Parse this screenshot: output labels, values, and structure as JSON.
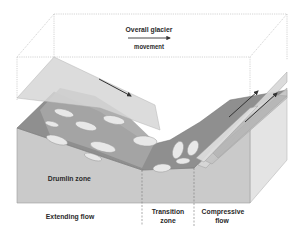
{
  "diagram": {
    "title_lines": [
      "Overall glacier",
      "movement"
    ],
    "zone_label": "Drumlin zone",
    "bottom_labels": [
      {
        "id": "extending",
        "lines": [
          "Extending flow"
        ]
      },
      {
        "id": "transition",
        "lines": [
          "Transition",
          "zone"
        ]
      },
      {
        "id": "compressive",
        "lines": [
          "Compressive",
          "flow"
        ]
      }
    ],
    "arrows": [
      {
        "id": "overall-movement",
        "direction": "right"
      },
      {
        "id": "extending-flow-arrow",
        "direction": "down-right"
      },
      {
        "id": "compressive-flow-arrow-1",
        "direction": "up-right"
      },
      {
        "id": "compressive-flow-arrow-2",
        "direction": "up-right"
      }
    ],
    "colors": {
      "front_face": "#c8c8c8",
      "side_face": "#e2e2e2",
      "bed_surface": "#8e8e8e",
      "glacier_plane": "#d4d4d4",
      "drumlin": "#e6e6e6",
      "outline": "#bdbdbd",
      "arrow": "#333333"
    }
  }
}
